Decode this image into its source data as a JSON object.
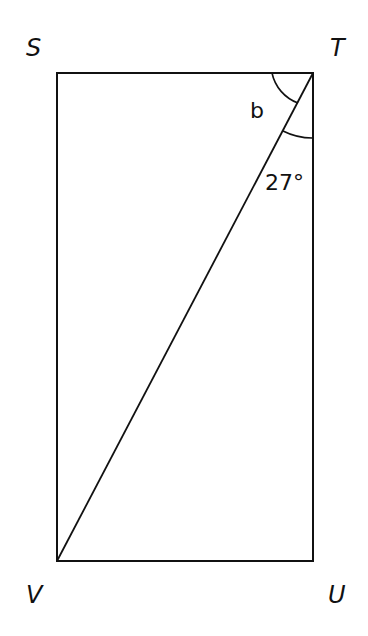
{
  "diagram": {
    "type": "rectangle-with-diagonal",
    "vertices": {
      "S": {
        "label": "S",
        "x": 57,
        "y": 73
      },
      "T": {
        "label": "T",
        "x": 313,
        "y": 73
      },
      "U": {
        "label": "U",
        "x": 313,
        "y": 561
      },
      "V": {
        "label": "V",
        "x": 57,
        "y": 561
      }
    },
    "diagonal": {
      "from": "T",
      "to": "V"
    },
    "angles": [
      {
        "name": "angle-b",
        "label": "b",
        "at": "T",
        "between": [
          "TS",
          "TV"
        ]
      },
      {
        "name": "angle-27",
        "label": "27°",
        "at": "T",
        "between": [
          "TV",
          "TU"
        ]
      }
    ],
    "stroke_color": "#111111",
    "background": "#ffffff"
  }
}
